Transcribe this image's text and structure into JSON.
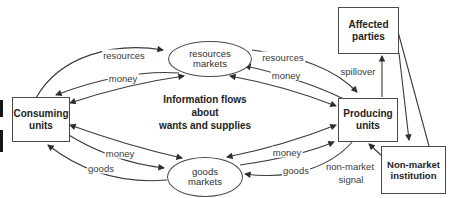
{
  "diagram": {
    "boxes": {
      "consuming": {
        "line1": "Consuming",
        "line2": "units"
      },
      "producing": {
        "line1": "Producing",
        "line2": "units"
      },
      "affected": {
        "line1": "Affected",
        "line2": "parties"
      },
      "nonmarket": {
        "line1": "Non-market",
        "line2": "institution"
      }
    },
    "markets": {
      "resources": {
        "line1": "resources",
        "line2": "markets"
      },
      "goods": {
        "line1": "goods",
        "line2": "markets"
      }
    },
    "center": {
      "line1": "Information flows",
      "line2": "about",
      "line3": "wants and supplies"
    },
    "flow_labels": {
      "resources_left": "resources",
      "money_left": "money",
      "resources_right": "resources",
      "money_right": "money",
      "money_bottom_left": "money",
      "goods_bottom_left": "goods",
      "money_bottom_right": "money",
      "goods_bottom_right": "goods",
      "spillover": "spillover",
      "nonmarket_signal_line1": "non-market",
      "nonmarket_signal_line2": "signal"
    },
    "colors": {
      "line": "#3a3a3a",
      "text": "#2e2e2e",
      "box_border": "#4a4a4a",
      "background": "#ffffff"
    }
  }
}
